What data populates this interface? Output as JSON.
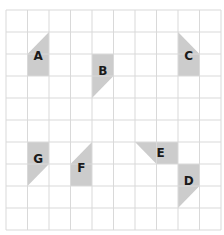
{
  "grid": {
    "cols": 10,
    "rows": 10,
    "x0": 6,
    "y0": 10,
    "cell_w": 21.5,
    "cell_h": 22,
    "line_color": "#d9d9d9"
  },
  "shape_color": "#cccccc",
  "shapes": [
    {
      "label": "A",
      "col": 1,
      "row": 1,
      "orientation": "vertical",
      "tri_end": "top",
      "diag": "up-right"
    },
    {
      "label": "B",
      "col": 4,
      "row": 2,
      "orientation": "vertical",
      "tri_end": "bottom",
      "diag": "up-right"
    },
    {
      "label": "C",
      "col": 8,
      "row": 1,
      "orientation": "vertical",
      "tri_end": "top",
      "diag": "down-right"
    },
    {
      "label": "D",
      "col": 8,
      "row": 7,
      "orientation": "vertical",
      "tri_end": "bottom",
      "diag": "up-right"
    },
    {
      "label": "E",
      "col": 6,
      "row": 6,
      "orientation": "horizontal",
      "tri_end": "left",
      "diag": "down-right"
    },
    {
      "label": "F",
      "col": 3,
      "row": 6,
      "orientation": "vertical",
      "tri_end": "top",
      "diag": "up-right"
    },
    {
      "label": "G",
      "col": 1,
      "row": 6,
      "orientation": "vertical",
      "tri_end": "bottom",
      "diag": "up-right"
    }
  ]
}
